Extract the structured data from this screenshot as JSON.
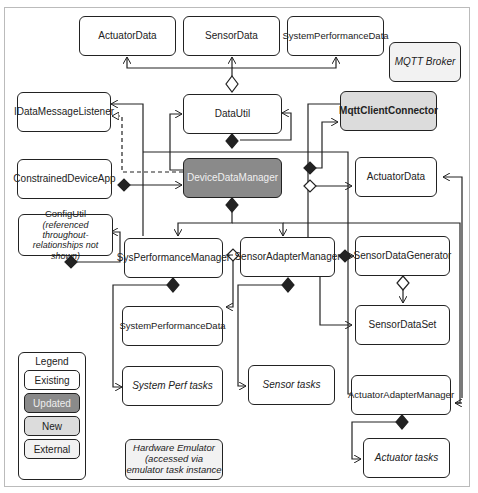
{
  "diagram": {
    "boxes": {
      "actuator_data_top": "ActuatorData",
      "sensor_data": "SensorData",
      "system_performance_data_top": "SystemPerformanceData",
      "mqtt_broker": "MQTT Broker",
      "idata_message_listener": "IDataMessageListener",
      "data_util": "DataUtil",
      "mqtt_client_connector": "MqttClientConnector",
      "constrained_device_app": "ConstrainedDeviceApp",
      "device_data_manager": "DeviceDataManager",
      "actuator_data_right": "ActuatorData",
      "config_util": "ConfigUtil",
      "config_util_note": "(referenced throughout-relationships not shown)",
      "sys_performance_manager": "SysPerformanceManager",
      "sensor_adapter_manager": "SensorAdapterManager",
      "sensor_data_generator": "SensorDataGenerator",
      "system_performance_data_bottom": "SystemPerformanceData",
      "sensor_data_set": "SensorDataSet",
      "system_perf_tasks": "System Perf tasks",
      "sensor_tasks": "Sensor tasks",
      "actuator_adapter_manager": "ActuatorAdapterManager",
      "hardware_emulator": "Hardware Emulator (accessed via emulator task instance",
      "actuator_tasks": "Actuator tasks"
    },
    "legend": {
      "title": "Legend",
      "items": [
        {
          "label": "Existing",
          "color": "#ffffff"
        },
        {
          "label": "Updated",
          "color": "#8a8a8a"
        },
        {
          "label": "New",
          "color": "#dcdcdc"
        },
        {
          "label": "External",
          "color": "#f2f2f2"
        }
      ]
    }
  }
}
